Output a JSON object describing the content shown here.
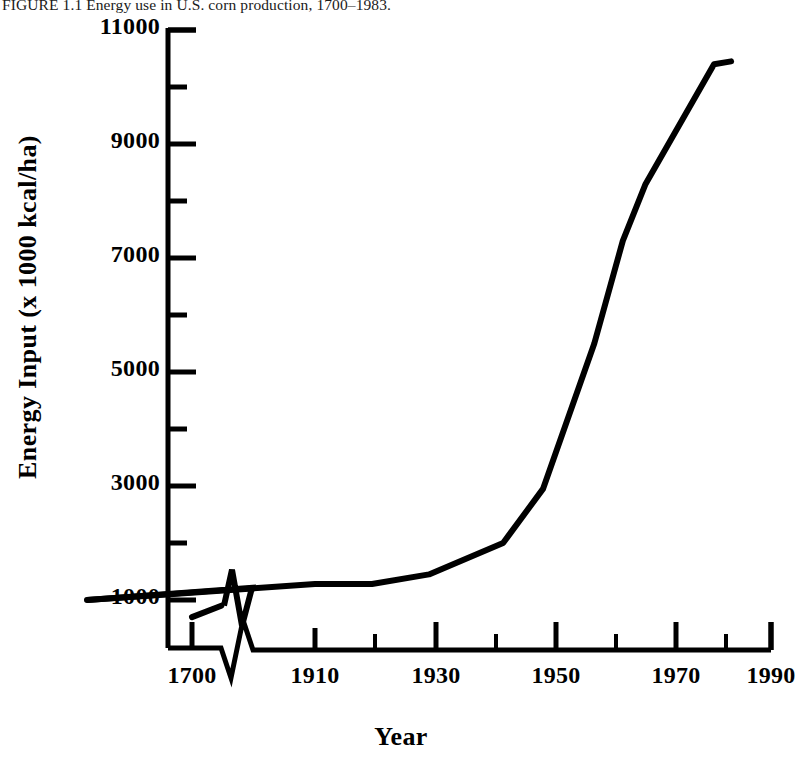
{
  "caption": {
    "label": "FIGURE 1.1",
    "text": "Energy use in U.S. corn production, 1700–1983.",
    "full": "FIGURE 1.1 Energy use in U.S. corn production, 1700–1983."
  },
  "chart_data": {
    "type": "line",
    "title": "Energy use in U.S. corn production, 1700–1983",
    "xlabel": "Year",
    "ylabel": "Energy Input (x 1000 kcal/ha)",
    "xlim": [
      1700,
      1990
    ],
    "ylim": [
      0,
      11000
    ],
    "xticks": [
      1700,
      1910,
      1930,
      1950,
      1970,
      1990
    ],
    "xtick_labels": [
      "1700",
      "1910",
      "1930",
      "1950",
      "1970",
      "1990"
    ],
    "x_minor_ticks": [
      1920,
      1940,
      1960,
      1980
    ],
    "yticks": [
      1000,
      3000,
      5000,
      7000,
      9000,
      11000
    ],
    "ytick_labels": [
      "1000",
      "3000",
      "5000",
      "7000",
      "9000",
      "11000"
    ],
    "y_minor_ticks": [
      2000,
      4000,
      6000,
      8000,
      10000
    ],
    "grid": false,
    "legend": null,
    "axis_break": {
      "axis": "x",
      "between": [
        1760,
        1860
      ],
      "style": "zigzag"
    },
    "series": [
      {
        "name": "Energy input",
        "color": "#000000",
        "line_width": 3,
        "segment_before_break": {
          "x": [
            1700,
            1755
          ],
          "y": [
            700,
            900
          ]
        },
        "segment_after_break": {
          "x": [
            1870,
            1910,
            1920,
            1930,
            1943,
            1950,
            1959,
            1964,
            1968,
            1980,
            1983
          ],
          "y": [
            1000,
            1280,
            1280,
            1450,
            2000,
            2950,
            5500,
            7300,
            8300,
            10400,
            10450
          ]
        }
      }
    ]
  },
  "axes_geometry": {
    "plot_left_px": 168,
    "plot_right_px": 772,
    "plot_top_px": 30,
    "plot_bottom_px": 648,
    "y_value_at_bottom": 130,
    "note": "pixel geometry used to place ticks"
  },
  "ytick_positions_px": {
    "1000": 600,
    "3000": 486,
    "5000": 372,
    "7000": 258,
    "9000": 144,
    "11000": 30
  },
  "xtick_positions_px": {
    "1700": 192,
    "1910": 315,
    "1930": 436,
    "1950": 556,
    "1970": 676,
    "1990": 771
  }
}
